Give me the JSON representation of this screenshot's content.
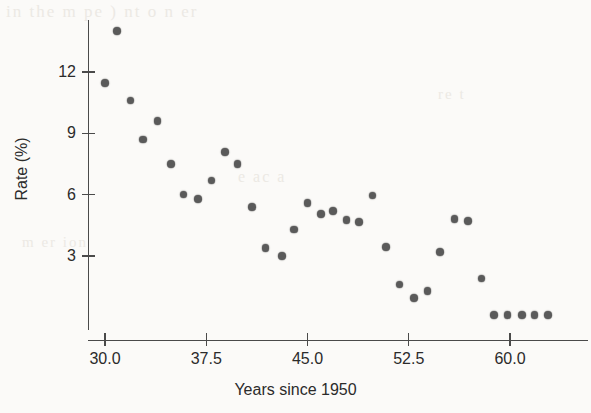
{
  "figure": {
    "background_color": "#fbfaf8",
    "marker_color": "#5a5a5a",
    "axis_color": "#4a4a4a"
  },
  "ghost_text": {
    "line1": "in the m  pe    )  nt  o    n  er",
    "line2": "e  ac  a",
    "line3": "m  er  ion",
    "line4": "re  t"
  },
  "chart_data": {
    "type": "scatter",
    "title": "",
    "xlabel": "Years since 1950",
    "ylabel": "Rate (%)",
    "xlim": [
      29.0,
      64.0
    ],
    "ylim": [
      -0.6,
      14.8
    ],
    "grid": false,
    "legend": null,
    "xticks": [
      30.0,
      37.5,
      45.0,
      52.5,
      60.0
    ],
    "xtick_labels": [
      "30.0",
      "37.5",
      "45.0",
      "52.5",
      "60.0"
    ],
    "yticks": [
      3,
      6,
      9,
      12
    ],
    "ytick_labels": [
      "3",
      "6",
      "9",
      "12"
    ],
    "series": [
      {
        "name": "rate",
        "x": [
          30.9,
          30.0,
          31.9,
          32.8,
          33.9,
          34.9,
          35.8,
          36.9,
          37.9,
          38.9,
          39.8,
          40.9,
          41.9,
          43.1,
          44.0,
          45.0,
          46.0,
          46.9,
          47.9,
          48.8,
          49.8,
          50.8,
          51.8,
          52.9,
          53.9,
          54.8,
          55.9,
          56.9,
          57.9,
          58.8,
          59.8,
          60.9,
          61.8,
          62.8
        ],
        "y": [
          14.0,
          11.45,
          10.6,
          8.7,
          9.6,
          7.5,
          6.0,
          5.8,
          6.7,
          8.1,
          7.5,
          5.4,
          3.4,
          3.0,
          4.3,
          5.6,
          5.05,
          5.2,
          4.75,
          4.65,
          5.95,
          3.45,
          1.6,
          0.95,
          1.3,
          3.2,
          4.8,
          4.7,
          1.9,
          0.1,
          0.1,
          0.1,
          0.1,
          0.1
        ]
      }
    ]
  },
  "axes_pixel_mapping": {
    "x_pixel_at_30": 105,
    "x_pixels_per_unit": 13.5,
    "y_pixel_at_3": 256,
    "y_pixels_per_unit": 20.44
  }
}
